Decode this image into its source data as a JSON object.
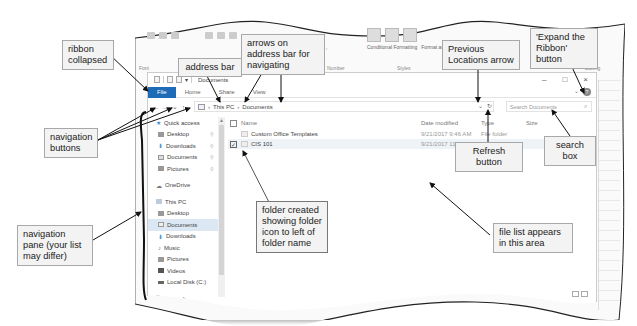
{
  "excel_ribbon": {
    "groups": [
      "Font",
      "Alignment",
      "Number",
      "Styles",
      "Cells",
      "Editing"
    ],
    "buttons": {
      "number_format": "$ - % ,",
      "conditional_formatting": "Conditional Formatting",
      "format_as_table": "Format as Table",
      "clear": "Clear",
      "filter": "Filter",
      "find_select": "Find & Select"
    }
  },
  "explorer": {
    "title": "Documents",
    "window_controls": {
      "minimize": "–",
      "maximize": "□",
      "close": "×"
    },
    "ribbon_tabs": {
      "file": "File",
      "home": "Home",
      "share": "Share",
      "view": "View"
    },
    "help": "?",
    "expand_ribbon": "⌄",
    "nav_buttons": {
      "back": "←",
      "forward": "→",
      "recent": "⌄",
      "up": "↑"
    },
    "address": {
      "segments": [
        "This PC",
        "Documents"
      ],
      "separator": "›"
    },
    "previous_locations": "⌄",
    "refresh": "↻",
    "search": {
      "placeholder": "Search Documents",
      "icon": "⌕"
    },
    "nav_pane": {
      "quick_access": "Quick access",
      "quick_items": [
        {
          "label": "Desktop",
          "pinned": true
        },
        {
          "label": "Downloads",
          "pinned": true
        },
        {
          "label": "Documents",
          "pinned": true
        },
        {
          "label": "Pictures",
          "pinned": true
        }
      ],
      "onedrive": "OneDrive",
      "this_pc": "This PC",
      "pc_items": [
        {
          "label": "Desktop"
        },
        {
          "label": "Documents",
          "selected": true
        },
        {
          "label": "Downloads"
        },
        {
          "label": "Music"
        },
        {
          "label": "Pictures"
        },
        {
          "label": "Videos"
        },
        {
          "label": "Local Disk (C:)"
        }
      ],
      "network": "Network"
    },
    "file_list": {
      "columns": {
        "name": "Name",
        "date": "Date modified",
        "type": "Type",
        "size": "Size"
      },
      "rows": [
        {
          "name": "Custom Office Templates",
          "date": "9/21/2017 9:46 AM",
          "type": "File folder",
          "selected": false
        },
        {
          "name": "CIS 101",
          "date": "9/21/2017 11:48 ...",
          "type": "File folder",
          "selected": true
        }
      ]
    },
    "status_text": "selected"
  },
  "callouts": {
    "ribbon_collapsed": "ribbon collapsed",
    "address_bar": "address bar",
    "arrows_address_bar": "arrows on address bar for navigating",
    "previous_locations": "Previous Locations arrow",
    "expand_ribbon": "'Expand the Ribbon' button",
    "navigation_buttons": "navigation buttons",
    "refresh_button": "Refresh button",
    "search_box": "search box",
    "folder_created": "folder created showing folder icon to left of folder name",
    "navigation_pane": "navigation pane (your list may differ)",
    "file_list_area": "file list appears in this area"
  }
}
